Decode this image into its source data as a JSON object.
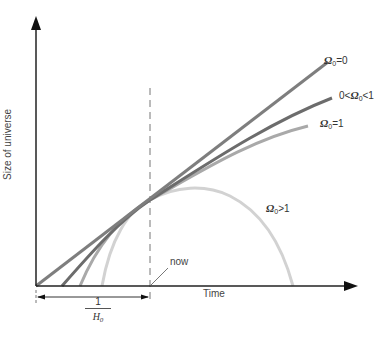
{
  "diagram": {
    "y_axis_label": "Size of universe",
    "x_axis_label": "Time",
    "now_label": "now",
    "hubble_time": {
      "numerator": "1",
      "denominator": "H",
      "denominator_sub": "0"
    },
    "curves": [
      {
        "id": "omega-zero",
        "symbol": "Ω",
        "sub": "0",
        "relation": "=0",
        "prefix": "",
        "color": "#7a7a7a"
      },
      {
        "id": "omega-between",
        "symbol": "Ω",
        "sub": "0",
        "relation": "<1",
        "prefix": "0<",
        "color": "#6a6a6a"
      },
      {
        "id": "omega-one",
        "symbol": "Ω",
        "sub": "0",
        "relation": "=1",
        "prefix": "",
        "color": "#a8a8a8"
      },
      {
        "id": "omega-greater",
        "symbol": "Ω",
        "sub": "0",
        "relation": ">1",
        "prefix": "",
        "color": "#d0d0d0"
      }
    ]
  }
}
